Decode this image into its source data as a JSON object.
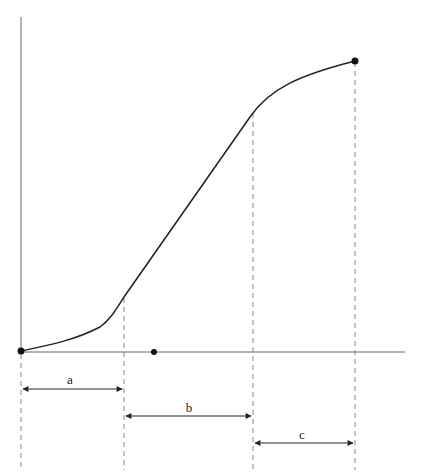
{
  "diagram": {
    "type": "growth-curve-with-phases",
    "axes": {
      "color": "#555555"
    },
    "curve": {
      "color": "#222222"
    },
    "points": {
      "origin": [
        21,
        351
      ],
      "mid_dot": [
        154,
        352
      ],
      "knee_a": [
        124,
        297
      ],
      "knee_b": [
        253,
        113
      ],
      "end": [
        355,
        61
      ]
    },
    "intervals": [
      {
        "label": "a",
        "x1": 21,
        "x2": 124,
        "y": 389
      },
      {
        "label": "b",
        "x1": 124,
        "x2": 253,
        "y": 416
      },
      {
        "label": "c",
        "x1": 253,
        "x2": 355,
        "y": 443
      }
    ]
  }
}
